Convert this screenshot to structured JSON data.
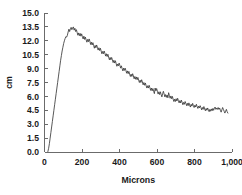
{
  "chart_data": {
    "type": "line",
    "title": "",
    "subtitle": "",
    "xlabel": "Microns",
    "ylabel": "cm",
    "xlim": [
      0,
      1000
    ],
    "ylim": [
      0,
      15
    ],
    "grid": false,
    "legend": null,
    "legend_position": "none",
    "x_ticks": [
      0,
      200,
      400,
      600,
      800,
      1000
    ],
    "x_tick_labels": [
      "0",
      "200",
      "400",
      "600",
      "800",
      "1,000"
    ],
    "y_ticks": [
      0.0,
      1.5,
      3.0,
      4.5,
      6.0,
      7.5,
      9.0,
      10.5,
      12.0,
      13.5,
      15.0
    ],
    "y_tick_labels": [
      "0.0",
      "1.5",
      "3.0",
      "4.5",
      "6.0",
      "7.5",
      "9.0",
      "10.5",
      "12.0",
      "13.5",
      "15.0"
    ],
    "line_color": "#3a3a3a",
    "annotations": [],
    "series": [
      {
        "name": "profile",
        "x": [
          18,
          22,
          26,
          30,
          34,
          38,
          42,
          46,
          50,
          54,
          58,
          62,
          66,
          70,
          74,
          78,
          82,
          86,
          90,
          94,
          98,
          102,
          106,
          110,
          114,
          118,
          122,
          126,
          130,
          134,
          138,
          142,
          146,
          150,
          154,
          158,
          162,
          166,
          170,
          174,
          178,
          182,
          186,
          190,
          194,
          198,
          202,
          206,
          210,
          214,
          218,
          222,
          226,
          230,
          234,
          238,
          242,
          246,
          250,
          254,
          258,
          262,
          266,
          270,
          274,
          278,
          282,
          286,
          290,
          294,
          298,
          302,
          306,
          310,
          314,
          318,
          322,
          326,
          330,
          334,
          338,
          342,
          346,
          350,
          354,
          358,
          362,
          366,
          370,
          374,
          378,
          382,
          386,
          390,
          394,
          398,
          402,
          406,
          410,
          414,
          418,
          422,
          426,
          430,
          434,
          438,
          442,
          446,
          450,
          454,
          458,
          462,
          466,
          470,
          474,
          478,
          482,
          486,
          490,
          494,
          498,
          502,
          506,
          510,
          514,
          518,
          522,
          526,
          530,
          534,
          538,
          542,
          546,
          550,
          554,
          558,
          562,
          566,
          570,
          574,
          578,
          582,
          586,
          590,
          594,
          598,
          602,
          606,
          610,
          614,
          618,
          622,
          626,
          630,
          634,
          638,
          642,
          646,
          650,
          654,
          658,
          662,
          666,
          670,
          674,
          678,
          682,
          686,
          690,
          694,
          698,
          702,
          706,
          710,
          714,
          718,
          722,
          726,
          730,
          734,
          738,
          742,
          746,
          750,
          754,
          758,
          762,
          766,
          770,
          774,
          778,
          782,
          786,
          790,
          794,
          798,
          802,
          806,
          810,
          814,
          818,
          822,
          826,
          830,
          834,
          838,
          842,
          846,
          850,
          854,
          858,
          862,
          866,
          870,
          874,
          878,
          882,
          886,
          890,
          894,
          898,
          902,
          906,
          910,
          914,
          918,
          922,
          926,
          930,
          934,
          938,
          942,
          946,
          950,
          954,
          958,
          962,
          966,
          970,
          974,
          978
        ],
        "y": [
          0.05,
          0.4,
          0.9,
          1.5,
          2.1,
          2.7,
          3.3,
          3.9,
          4.5,
          5.1,
          5.7,
          6.3,
          6.9,
          7.5,
          8.1,
          8.7,
          9.3,
          9.9,
          10.4,
          10.9,
          11.3,
          11.7,
          12.0,
          12.25,
          12.45,
          12.4,
          12.6,
          12.95,
          13.25,
          13.0,
          13.3,
          13.45,
          13.2,
          13.4,
          13.5,
          13.15,
          13.35,
          13.0,
          13.2,
          12.9,
          12.6,
          12.85,
          12.55,
          12.8,
          12.5,
          12.75,
          12.45,
          12.2,
          12.5,
          12.15,
          12.4,
          12.1,
          11.85,
          12.15,
          11.9,
          12.2,
          11.95,
          11.6,
          11.85,
          11.55,
          11.8,
          11.5,
          11.2,
          11.5,
          11.25,
          11.55,
          11.3,
          11.0,
          11.25,
          10.95,
          11.2,
          10.9,
          10.6,
          10.85,
          10.6,
          10.9,
          10.65,
          10.35,
          10.6,
          10.3,
          10.55,
          10.25,
          9.95,
          10.2,
          9.95,
          10.2,
          9.95,
          9.65,
          9.9,
          9.6,
          9.85,
          9.55,
          9.25,
          9.5,
          9.3,
          9.6,
          9.35,
          9.05,
          9.3,
          9.0,
          8.75,
          9.05,
          8.8,
          9.05,
          8.8,
          8.5,
          8.75,
          8.45,
          8.7,
          8.4,
          8.15,
          8.4,
          8.15,
          8.45,
          8.2,
          7.9,
          8.15,
          7.85,
          8.1,
          7.8,
          8.05,
          7.75,
          7.5,
          7.75,
          7.5,
          7.8,
          7.55,
          7.25,
          7.5,
          7.2,
          7.45,
          7.15,
          6.9,
          7.15,
          6.9,
          7.2,
          6.95,
          6.65,
          6.9,
          6.6,
          6.85,
          6.55,
          6.3,
          6.9,
          6.6,
          6.85,
          6.55,
          6.25,
          6.5,
          6.2,
          6.5,
          6.2,
          5.95,
          6.3,
          6.55,
          6.25,
          5.95,
          6.2,
          5.9,
          6.15,
          5.85,
          6.4,
          6.1,
          5.8,
          6.05,
          5.75,
          6.0,
          5.7,
          5.45,
          5.7,
          5.45,
          5.75,
          5.5,
          5.8,
          5.55,
          5.3,
          5.55,
          5.3,
          5.6,
          5.35,
          5.1,
          5.35,
          5.15,
          5.45,
          5.25,
          5.0,
          5.25,
          5.0,
          5.3,
          5.05,
          4.85,
          5.15,
          4.95,
          5.25,
          5.0,
          4.8,
          5.05,
          4.85,
          5.15,
          4.9,
          4.7,
          4.95,
          4.75,
          5.0,
          4.8,
          4.55,
          4.8,
          4.6,
          4.9,
          4.65,
          4.45,
          4.7,
          4.5,
          4.75,
          4.55,
          4.35,
          4.6,
          4.4,
          4.65,
          4.45,
          4.7,
          4.5,
          4.75,
          4.85,
          4.6,
          4.75,
          4.6,
          4.8,
          4.6,
          4.75,
          4.5,
          4.3,
          4.55,
          4.8,
          4.6,
          4.4,
          4.2,
          4.4,
          4.6,
          4.35,
          4.2
        ]
      }
    ]
  },
  "axis_labels": {
    "x_title": "Microns",
    "y_title": "cm"
  }
}
